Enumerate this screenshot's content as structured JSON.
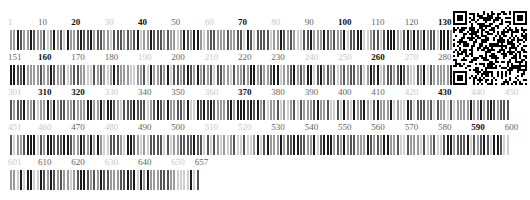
{
  "figure": {
    "type": "sequence-barcode",
    "total_length": 657,
    "positions_per_row": 150,
    "rows": [
      {
        "start": 1,
        "end": 150,
        "labels": [
          {
            "v": "1",
            "s": "f"
          },
          {
            "v": "10",
            "s": "g"
          },
          {
            "v": "20",
            "s": "b"
          },
          {
            "v": "30",
            "s": "f"
          },
          {
            "v": "40",
            "s": "b"
          },
          {
            "v": "50",
            "s": "g"
          },
          {
            "v": "60",
            "s": "f"
          },
          {
            "v": "70",
            "s": "b"
          },
          {
            "v": "80",
            "s": "f"
          },
          {
            "v": "90",
            "s": "g"
          },
          {
            "v": "100",
            "s": "b"
          },
          {
            "v": "110",
            "s": "g"
          },
          {
            "v": "120",
            "s": "g"
          },
          {
            "v": "130",
            "s": "b"
          },
          {
            "v": "140",
            "s": "g"
          },
          {
            "v": "150",
            "s": "g"
          }
        ]
      },
      {
        "start": 151,
        "end": 300,
        "labels": [
          {
            "v": "151",
            "s": "g"
          },
          {
            "v": "160",
            "s": "b"
          },
          {
            "v": "170",
            "s": "g"
          },
          {
            "v": "180",
            "s": "g"
          },
          {
            "v": "190",
            "s": "f"
          },
          {
            "v": "200",
            "s": "g"
          },
          {
            "v": "210",
            "s": "f"
          },
          {
            "v": "220",
            "s": "g"
          },
          {
            "v": "230",
            "s": "g"
          },
          {
            "v": "240",
            "s": "f"
          },
          {
            "v": "250",
            "s": "f"
          },
          {
            "v": "260",
            "s": "b"
          },
          {
            "v": "270",
            "s": "f"
          },
          {
            "v": "280",
            "s": "g"
          },
          {
            "v": "290",
            "s": "g"
          },
          {
            "v": "300",
            "s": "f"
          }
        ]
      },
      {
        "start": 301,
        "end": 450,
        "labels": [
          {
            "v": "301",
            "s": "f"
          },
          {
            "v": "310",
            "s": "b"
          },
          {
            "v": "320",
            "s": "b"
          },
          {
            "v": "330",
            "s": "f"
          },
          {
            "v": "340",
            "s": "g"
          },
          {
            "v": "350",
            "s": "g"
          },
          {
            "v": "360",
            "s": "f"
          },
          {
            "v": "370",
            "s": "b"
          },
          {
            "v": "380",
            "s": "g"
          },
          {
            "v": "390",
            "s": "g"
          },
          {
            "v": "400",
            "s": "g"
          },
          {
            "v": "410",
            "s": "g"
          },
          {
            "v": "420",
            "s": "f"
          },
          {
            "v": "430",
            "s": "b"
          },
          {
            "v": "440",
            "s": "f"
          },
          {
            "v": "450",
            "s": "f"
          }
        ]
      },
      {
        "start": 451,
        "end": 600,
        "labels": [
          {
            "v": "451",
            "s": "f"
          },
          {
            "v": "460",
            "s": "f"
          },
          {
            "v": "470",
            "s": "g"
          },
          {
            "v": "480",
            "s": "f"
          },
          {
            "v": "490",
            "s": "g"
          },
          {
            "v": "500",
            "s": "g"
          },
          {
            "v": "510",
            "s": "f"
          },
          {
            "v": "520",
            "s": "f"
          },
          {
            "v": "530",
            "s": "g"
          },
          {
            "v": "540",
            "s": "g"
          },
          {
            "v": "550",
            "s": "g"
          },
          {
            "v": "560",
            "s": "g"
          },
          {
            "v": "570",
            "s": "g"
          },
          {
            "v": "580",
            "s": "g"
          },
          {
            "v": "590",
            "s": "b"
          },
          {
            "v": "600",
            "s": "g"
          }
        ]
      },
      {
        "start": 601,
        "end": 657,
        "labels": [
          {
            "v": "601",
            "s": "f"
          },
          {
            "v": "610",
            "s": "g"
          },
          {
            "v": "620",
            "s": "g"
          },
          {
            "v": "630",
            "s": "f"
          },
          {
            "v": "640",
            "s": "g"
          },
          {
            "v": "650",
            "s": "f"
          },
          {
            "v": "657",
            "s": "g"
          }
        ]
      }
    ],
    "bar_colors": {
      "dark": "#1a1a1a",
      "mid": "#555555",
      "light": "#9a9a9a",
      "faint": "#cfcfcf"
    },
    "qr_code": {
      "icon": "qr-code-icon"
    }
  }
}
